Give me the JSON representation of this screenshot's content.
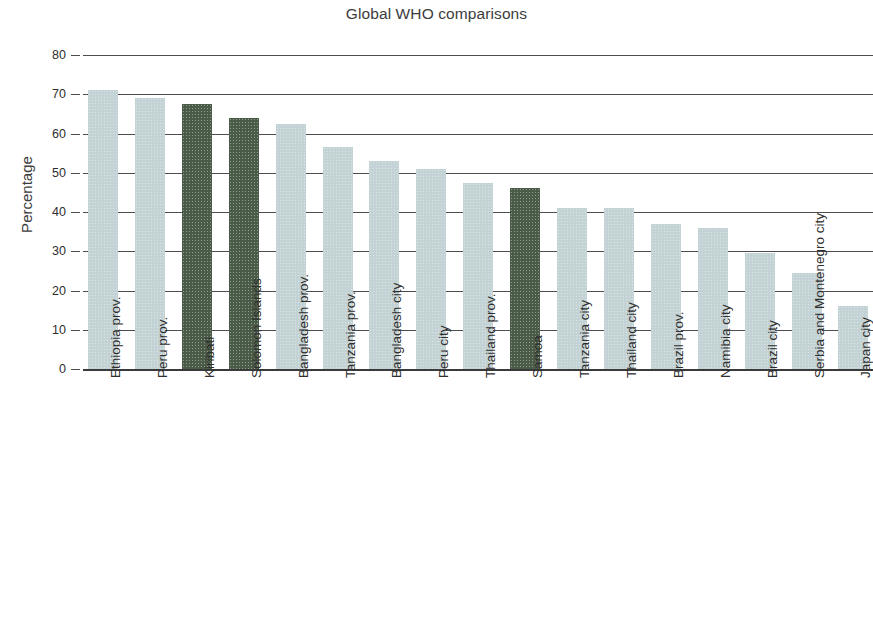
{
  "chart_data": {
    "type": "bar",
    "title": "Global WHO comparisons",
    "xlabel": "",
    "ylabel": "Percentage",
    "ylim": [
      0,
      80
    ],
    "yticks": [
      0,
      10,
      20,
      30,
      40,
      50,
      60,
      70,
      80
    ],
    "grid": true,
    "legend": null,
    "note": "Final bar (Japan city) is clipped at the right edge of the figure.",
    "colors": {
      "light": "#c3d2d4",
      "dark": "#4a5c48",
      "axis": "#3a3a3a",
      "gridline": "#4d4d4d",
      "text": "#2e2e2e"
    },
    "categories": [
      "Ethiopia prov.",
      "Peru prov.",
      "Kiribati",
      "Solomon Islands",
      "Bangladesh prov.",
      "Tanzania prov.",
      "Bangladesh city",
      "Peru city",
      "Thailand prov.",
      "Samoa",
      "Tanzania city",
      "Thailand city",
      "Brazil prov.",
      "Namibia city",
      "Brazil city",
      "Serbia and Montenegro city",
      "Japan city"
    ],
    "values": [
      71,
      69,
      67.5,
      64,
      62.5,
      56.5,
      53,
      51,
      47.5,
      46,
      41,
      41,
      37,
      36,
      29.5,
      24.5,
      16
    ],
    "bar_colors": [
      "light",
      "light",
      "dark",
      "dark",
      "light",
      "light",
      "light",
      "light",
      "light",
      "dark",
      "light",
      "light",
      "light",
      "light",
      "light",
      "light",
      "light"
    ]
  }
}
